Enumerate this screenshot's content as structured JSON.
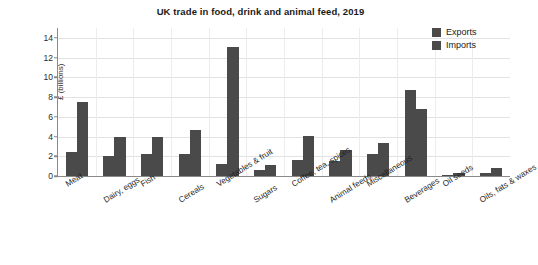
{
  "chart_data": {
    "type": "bar",
    "title": "UK trade in food, drink and animal feed, 2019",
    "xlabel": "",
    "ylabel": "£ (billions)",
    "ylim": [
      0,
      15
    ],
    "yticks": [
      0,
      2,
      4,
      6,
      8,
      10,
      12,
      14
    ],
    "ytick_labels": [
      "0",
      "2",
      "4",
      "6",
      "8",
      "10",
      "12",
      "14"
    ],
    "grid": true,
    "legend_position": "top-right",
    "categories": [
      "Meat",
      "Dairy, eggs",
      "Fish",
      "Cereals",
      "Vegetables & fruit",
      "Sugars",
      "Coffee, tea, spices",
      "Animal feeds",
      "Miscellaneous",
      "Beverages",
      "Oil seeds",
      "Oils, fats & waxes"
    ],
    "series": [
      {
        "name": "Exports",
        "color": "#4a4a4a",
        "values": [
          2.4,
          2.0,
          2.2,
          2.2,
          1.2,
          0.6,
          1.6,
          1.5,
          2.2,
          8.7,
          0.1,
          0.3
        ]
      },
      {
        "name": "Imports",
        "color": "#4a4a4a",
        "values": [
          7.5,
          4.0,
          4.0,
          4.7,
          13.1,
          1.1,
          4.1,
          2.6,
          3.3,
          6.8,
          0.3,
          0.8
        ]
      }
    ]
  },
  "legend": {
    "items": [
      {
        "label": "Exports"
      },
      {
        "label": "Imports"
      }
    ]
  }
}
